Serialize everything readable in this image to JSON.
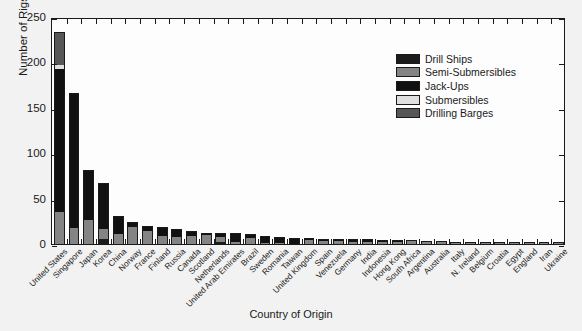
{
  "chart_data": {
    "type": "bar",
    "subtype": "stacked-vertical",
    "title": "",
    "xlabel": "Country of Origin",
    "ylabel": "Number of Rigs",
    "ylim": [
      0,
      250
    ],
    "yticks": [
      0,
      50,
      100,
      150,
      200,
      250
    ],
    "grid": false,
    "legend_position": "top-right",
    "categories": [
      "United States",
      "Singapore",
      "Japan",
      "Korea",
      "China",
      "Norway",
      "France",
      "Finland",
      "Russia",
      "Canada",
      "Scotland",
      "Netherlands",
      "United Arab Emirates",
      "Brazil",
      "Sweden",
      "Romania",
      "Taiwan",
      "United Kingdom",
      "Spain",
      "Venezuela",
      "Germany",
      "India",
      "Indonesia",
      "Hong Kong",
      "South Africa",
      "Argentina",
      "Australia",
      "Italy",
      "N. Ireland",
      "Belgium",
      "Croatia",
      "Egypt",
      "England",
      "Iran",
      "Ukraine"
    ],
    "series": [
      {
        "name": "Drill Ships",
        "color": "#1c1c1c",
        "values": [
          0,
          0,
          0,
          6,
          0,
          0,
          0,
          0,
          0,
          0,
          0,
          2,
          0,
          0,
          0,
          0,
          0,
          0,
          0,
          0,
          0,
          0,
          0,
          0,
          0,
          0,
          0,
          0,
          0,
          0,
          0,
          0,
          0,
          0,
          0
        ]
      },
      {
        "name": "Semi-Submersibles",
        "color": "#848484",
        "values": [
          35,
          18,
          26,
          11,
          11,
          19,
          14,
          9,
          8,
          9,
          10,
          6,
          2,
          7,
          1,
          1,
          0,
          4,
          3,
          3,
          2,
          2,
          2,
          2,
          3,
          2,
          2,
          1,
          1,
          1,
          1,
          1,
          1,
          1,
          1
        ]
      },
      {
        "name": "Jack-Ups",
        "color": "#111111",
        "values": [
          158,
          148,
          56,
          50,
          20,
          5,
          6,
          10,
          9,
          5,
          2,
          4,
          10,
          4,
          8,
          7,
          7,
          3,
          3,
          3,
          3,
          3,
          2,
          2,
          1,
          1,
          1,
          1,
          1,
          1,
          1,
          1,
          1,
          1,
          1
        ]
      },
      {
        "name": "Submersibles",
        "color": "#e0e0e0",
        "values": [
          4,
          0,
          0,
          0,
          0,
          0,
          0,
          0,
          0,
          0,
          0,
          0,
          0,
          0,
          0,
          0,
          0,
          0,
          0,
          0,
          0,
          0,
          0,
          0,
          0,
          0,
          0,
          0,
          0,
          0,
          0,
          0,
          0,
          0,
          0
        ]
      },
      {
        "name": "Drilling Barges",
        "color": "#575757",
        "values": [
          36,
          0,
          0,
          0,
          0,
          0,
          0,
          0,
          0,
          0,
          0,
          0,
          0,
          0,
          0,
          0,
          0,
          0,
          0,
          0,
          0,
          0,
          0,
          0,
          0,
          0,
          0,
          0,
          0,
          0,
          0,
          0,
          0,
          0,
          0
        ]
      }
    ],
    "totals": [
      233,
      166,
      82,
      67,
      31,
      24,
      20,
      19,
      17,
      14,
      12,
      12,
      12,
      11,
      9,
      8,
      7,
      7,
      6,
      6,
      5,
      5,
      4,
      4,
      4,
      3,
      3,
      2,
      2,
      2,
      2,
      2,
      2,
      2,
      2
    ]
  },
  "legend": {
    "entries": [
      {
        "label": "Drill Ships",
        "color": "#1c1c1c"
      },
      {
        "label": "Semi-Submersibles",
        "color": "#848484"
      },
      {
        "label": "Jack-Ups",
        "color": "#111111"
      },
      {
        "label": "Submersibles",
        "color": "#e0e0e0"
      },
      {
        "label": "Drilling Barges",
        "color": "#575757"
      }
    ]
  },
  "axes": {
    "y_title": "Number of Rigs",
    "x_title": "Country of Origin",
    "y_tick_labels": [
      "0",
      "50",
      "100",
      "150",
      "200",
      "250"
    ],
    "axis_color": "#1a1a1a",
    "plot_background": "#fdfdfd",
    "figure_background": "#f2f2f2"
  }
}
